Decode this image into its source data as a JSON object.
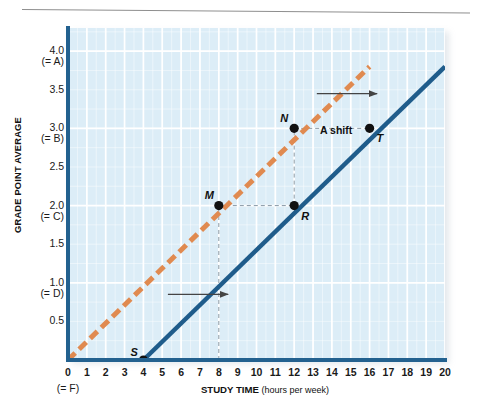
{
  "figure": {
    "top_rule": "horizontal-rule"
  },
  "chart_data": {
    "type": "line",
    "title": "",
    "xlabel_bold": "STUDY TIME",
    "xlabel_note": "(hours per week)",
    "ylabel": "GRADE POINT AVERAGE",
    "xlim": [
      0,
      20
    ],
    "ylim": [
      0,
      4.3
    ],
    "grid": true,
    "grid_major_x": 1,
    "grid_minor_y": 0.25,
    "legend": "none",
    "x_ticks": [
      0,
      1,
      2,
      3,
      4,
      5,
      6,
      7,
      8,
      9,
      10,
      11,
      12,
      13,
      14,
      15,
      16,
      17,
      18,
      19,
      20
    ],
    "x_tick_labels": [
      "0",
      "1",
      "2",
      "3",
      "4",
      "5",
      "6",
      "7",
      "8",
      "9",
      "10",
      "11",
      "12",
      "13",
      "14",
      "15",
      "16",
      "17",
      "18",
      "19",
      "20"
    ],
    "x_zero_sublabel": "(= F)",
    "y_ticks": [
      0.5,
      1.0,
      1.5,
      2.0,
      2.5,
      3.0,
      3.5,
      4.0
    ],
    "y_tick_labels": [
      {
        "value": "0.5",
        "grade": ""
      },
      {
        "value": "1.0",
        "grade": "(= D)"
      },
      {
        "value": "1.5",
        "grade": ""
      },
      {
        "value": "2.0",
        "grade": "(= C)"
      },
      {
        "value": "2.5",
        "grade": ""
      },
      {
        "value": "3.0",
        "grade": "(= B)"
      },
      {
        "value": "3.5",
        "grade": ""
      },
      {
        "value": "4.0",
        "grade": "(= A)"
      }
    ],
    "series": [
      {
        "name": "original-curve",
        "style": "dashed",
        "color": "#e08a50",
        "x": [
          0,
          16
        ],
        "y": [
          0,
          3.8
        ]
      },
      {
        "name": "shifted-curve",
        "style": "solid",
        "color": "#1f5c8b",
        "x": [
          4,
          20
        ],
        "y": [
          0,
          3.8
        ]
      }
    ],
    "points": [
      {
        "label": "S",
        "x": 4,
        "y": 0.0,
        "on": "shifted-curve"
      },
      {
        "label": "M",
        "x": 8,
        "y": 2.0,
        "on": "original-curve"
      },
      {
        "label": "R",
        "x": 12,
        "y": 2.0,
        "on": "shifted-curve"
      },
      {
        "label": "N",
        "x": 12,
        "y": 3.0,
        "on": "original-curve"
      },
      {
        "label": "T",
        "x": 16,
        "y": 3.0,
        "on": "shifted-curve"
      }
    ],
    "annotations": [
      {
        "name": "shift-label",
        "text": "A shift",
        "x": 14,
        "y": 3.25
      },
      {
        "name": "shift-arrow-upper",
        "type": "arrow",
        "from_x": 13.2,
        "to_x": 16.4,
        "y": 3.45
      },
      {
        "name": "shift-arrow-lower",
        "type": "arrow",
        "from_x": 5.3,
        "to_x": 8.5,
        "y": 0.85
      }
    ],
    "guides": [
      {
        "name": "guide-m-to-r",
        "type": "horizontal-dashed",
        "y": 2.0,
        "from_x": 8,
        "to_x": 12
      },
      {
        "name": "guide-n-to-t",
        "type": "horizontal-dashed",
        "y": 3.0,
        "from_x": 12,
        "to_x": 16
      },
      {
        "name": "guide-m-vertical",
        "type": "vertical-dashed",
        "x": 8,
        "from_y": 0,
        "to_y": 2.0
      },
      {
        "name": "guide-n-vertical",
        "type": "vertical-dashed",
        "x": 12,
        "from_y": 2.0,
        "to_y": 3.0
      }
    ]
  },
  "colors": {
    "plot_background": "#dcedf7",
    "gridline": "#ffffff",
    "axis": "#23618f",
    "original_curve": "#e08a50",
    "shifted_curve": "#1f5c8b",
    "point": "#111111",
    "guide": "#8a9aa6",
    "rule": "#8e8e8e"
  }
}
